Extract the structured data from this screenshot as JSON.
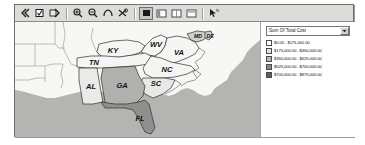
{
  "window": {
    "title": ""
  },
  "toolbar": {
    "groups": [
      {
        "name": "nav-group",
        "buttons": [
          {
            "icon": "back-arrow-icon",
            "label": "Back",
            "pressed": false
          },
          {
            "icon": "checkbox-icon",
            "label": "Select",
            "pressed": false
          },
          {
            "icon": "forward-arrow-icon",
            "label": "Forward",
            "pressed": false
          }
        ]
      },
      {
        "name": "zoom-group",
        "buttons": [
          {
            "icon": "zoom-in-icon",
            "label": "Zoom In",
            "pressed": false
          },
          {
            "icon": "zoom-out-icon",
            "label": "Zoom Out",
            "pressed": false
          },
          {
            "icon": "pan-hand-icon",
            "label": "Pan",
            "pressed": false
          },
          {
            "icon": "zoom-extent-icon",
            "label": "Full Extent",
            "pressed": false
          }
        ]
      },
      {
        "name": "layout-group",
        "buttons": [
          {
            "icon": "layer-full-icon",
            "label": "Map View",
            "pressed": true
          },
          {
            "icon": "layer-left-icon",
            "label": "Left Panel",
            "pressed": false
          },
          {
            "icon": "layer-grid-icon",
            "label": "Grid View",
            "pressed": false
          },
          {
            "icon": "layer-wide-icon",
            "label": "Wide View",
            "pressed": false
          }
        ]
      },
      {
        "name": "tool-group",
        "buttons": [
          {
            "icon": "pointer-label-icon",
            "label": "Identify",
            "pressed": false
          }
        ]
      }
    ]
  },
  "map": {
    "ocean_color": "#b4b4b2",
    "land_color": "#f7f7f5",
    "border_color": "#3a3a3a",
    "states": [
      {
        "code": "KY",
        "label": "KY",
        "fill": "#f5f5f3"
      },
      {
        "code": "WV",
        "label": "WV",
        "fill": "#f5f5f3"
      },
      {
        "code": "VA",
        "label": "VA",
        "fill": "#f5f5f3"
      },
      {
        "code": "MD",
        "label": "MD",
        "fill": "#cfcfcd"
      },
      {
        "code": "DE",
        "label": "DE",
        "fill": "#cfcfcd"
      },
      {
        "code": "TN",
        "label": "TN",
        "fill": "#f5f5f3"
      },
      {
        "code": "NC",
        "label": "NC",
        "fill": "#f5f5f3"
      },
      {
        "code": "SC",
        "label": "SC",
        "fill": "#e8e8e6"
      },
      {
        "code": "AL",
        "label": "AL",
        "fill": "#eaeae8"
      },
      {
        "code": "GA",
        "label": "GA",
        "fill": "#b0b0ae"
      },
      {
        "code": "FL",
        "label": "FL",
        "fill": "#8f8f8d"
      }
    ]
  },
  "legend": {
    "field_selector": {
      "value": "Sum Of Total Cost",
      "options": [
        "Sum Of Total Cost"
      ]
    },
    "classes": [
      {
        "range": "$0.00 - $175,000.00",
        "color": "#ffffff"
      },
      {
        "range": "$175,000.00 - $350,000.00",
        "color": "#e2e2e0"
      },
      {
        "range": "$350,000.00 - $525,000.00",
        "color": "#b6b6b4"
      },
      {
        "range": "$525,000.00 - $700,000.00",
        "color": "#8a8a88"
      },
      {
        "range": "$700,000.00 - $875,000.00",
        "color": "#5c5c5a"
      }
    ]
  }
}
